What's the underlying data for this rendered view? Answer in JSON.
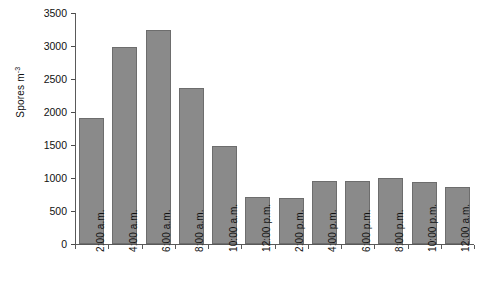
{
  "chart_data": {
    "type": "bar",
    "title": "",
    "xlabel": "",
    "ylabel": "Spores m⁻³",
    "ylabel_base": "Spores m",
    "ylabel_exponent": "-3",
    "ylim": [
      0,
      3500
    ],
    "ytick_step": 500,
    "grid": false,
    "legend": false,
    "bar_color": "#8a8a8a",
    "bar_border_color": "#6d6d6d",
    "axis_color": "#5a5a5a",
    "categories": [
      "2:00 a.m.",
      "4:00 a.m.",
      "6:00 a.m.",
      "8:00 a.m.",
      "10:00 a.m.",
      "12:00 p.m.",
      "2:00 p.m.",
      "4:00 p.m.",
      "6:00 p.m.",
      "8:00 p.m.",
      "10:00 p.m.",
      "12:00 a.m."
    ],
    "values": [
      1910,
      2980,
      3240,
      2370,
      1490,
      710,
      700,
      960,
      950,
      1000,
      945,
      870
    ],
    "ytick_labels": [
      "0",
      "500",
      "1000",
      "1500",
      "2000",
      "2500",
      "3000",
      "3500"
    ],
    "ytick_values": [
      0,
      500,
      1000,
      1500,
      2000,
      2500,
      3000,
      3500
    ]
  }
}
